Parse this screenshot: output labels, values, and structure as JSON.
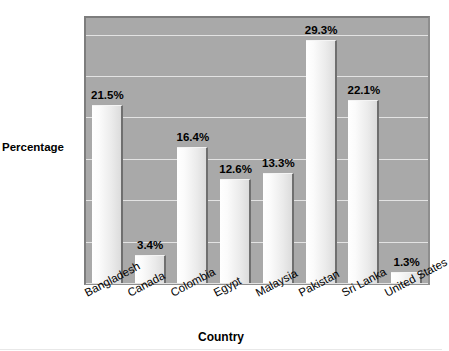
{
  "chart_data": {
    "type": "bar",
    "title": "",
    "xlabel": "Country",
    "ylabel": "Percentage",
    "categories": [
      "Bangladesh",
      "Canada",
      "Colombia",
      "Egypt",
      "Malaysia",
      "Pakistan",
      "Sri Lanka",
      "United States"
    ],
    "values": [
      21.5,
      3.4,
      16.4,
      12.6,
      13.3,
      29.3,
      22.1,
      1.3
    ],
    "value_labels": [
      "21.5%",
      "3.4%",
      "16.4%",
      "12.6%",
      "13.3%",
      "29.3%",
      "22.1%",
      "1.3%"
    ],
    "ylim": [
      0,
      32
    ],
    "yticks": [
      0,
      5,
      10,
      15,
      20,
      25,
      30
    ],
    "ytick_labels": [
      "0",
      "5",
      "10",
      "15",
      "20",
      "25",
      "30"
    ],
    "grid": true,
    "legend": false,
    "plot_background": "#a9a9a9",
    "bar_color": "#ededed",
    "gridline_color": "#e3e3e3",
    "text_color": "#000000"
  },
  "axes": {
    "y_title": "Percentage",
    "x_title": "Country"
  }
}
